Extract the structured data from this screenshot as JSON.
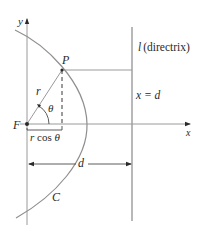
{
  "diagram": {
    "colors": {
      "line": "#9a9a9a",
      "text": "#2a2a2a",
      "curve": "#8f8f8f",
      "background": "#ffffff"
    },
    "labels": {
      "y_axis": "y",
      "x_axis": "x",
      "point_P": "P",
      "focus_F": "F",
      "radius": "r",
      "angle": "θ",
      "projection": "r cos θ",
      "directrix_name": "l",
      "directrix_paren": "(directrix)",
      "directrix_eq": "x = d",
      "distance": "d",
      "curve": "C"
    }
  }
}
